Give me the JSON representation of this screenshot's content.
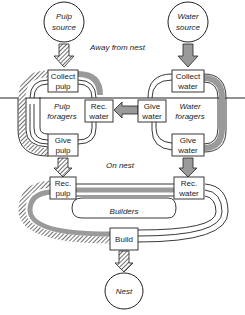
{
  "diagram": {
    "regions": {
      "away": "Away from nest",
      "on": "On nest"
    },
    "sources": {
      "pulp": [
        "Pulp",
        "source"
      ],
      "water": [
        "Water",
        "source"
      ],
      "nest": "Nest"
    },
    "boxes": {
      "collect_pulp": [
        "Collect",
        "pulp"
      ],
      "give_pulp": [
        "Give",
        "pulp"
      ],
      "rec_water_top": [
        "Rec.",
        "water"
      ],
      "give_water_mid": [
        "Give",
        "water"
      ],
      "collect_water": [
        "Collect",
        "water"
      ],
      "give_water_bottom": [
        "Give",
        "water"
      ],
      "rec_pulp": [
        "Rec.",
        "pulp"
      ],
      "rec_water_bottom": [
        "Rec.",
        "water"
      ],
      "build": "Build"
    },
    "groups": {
      "pulp_foragers": [
        "Pulp",
        "foragers"
      ],
      "water_foragers": [
        "Water",
        "foragers"
      ],
      "builders": "Builders"
    },
    "colors": {
      "line": "#222222",
      "gray_fill": "#9a9a9a",
      "hatch": "#444444"
    }
  }
}
